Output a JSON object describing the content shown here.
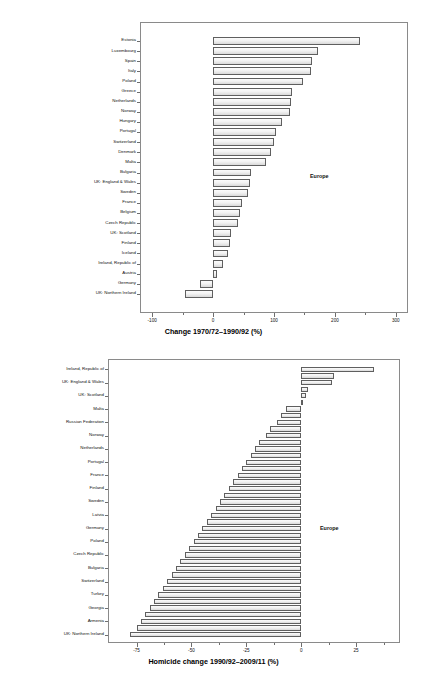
{
  "figure": {
    "background": "#ffffff",
    "bar_fill": "#eeeeee",
    "bar_edge": "#5f5f5f"
  },
  "chart_data": [
    {
      "id": "chart-top",
      "type": "bar",
      "orientation": "horizontal",
      "title": "",
      "xlabel": "Change 1970/72–1990/92 (%)",
      "ylabel": "",
      "xlim": [
        -120,
        320
      ],
      "xticks": [
        -100,
        0,
        100,
        200,
        300
      ],
      "xtick_labels": [
        "-100",
        "0",
        "100",
        "200",
        "300"
      ],
      "xminor_ticks": [
        -50,
        50,
        150,
        250
      ],
      "grid": false,
      "legend": "none",
      "annotation": "Europe",
      "categories": [
        "Estonia",
        "Luxembourg",
        "Spain",
        "Italy",
        "Poland",
        "Greece",
        "Netherlands",
        "Norway",
        "Hungary",
        "Portugal",
        "Switzerland",
        "Denmark",
        "Malta",
        "Bulgaria",
        "UK: England & Wales",
        "Sweden",
        "France",
        "Belgium",
        "Czech Republic",
        "UK: Scotland",
        "Finland",
        "Iceland",
        "Ireland, Republic of",
        "Austria",
        "Germany",
        "UK: Northern Ireland"
      ],
      "values": [
        241,
        172,
        162,
        160,
        147,
        130,
        128,
        127,
        113,
        103,
        100,
        95,
        87,
        62,
        60,
        57,
        48,
        45,
        41,
        30,
        28,
        24,
        17,
        7,
        -21,
        -46
      ]
    },
    {
      "id": "chart-bottom",
      "type": "bar",
      "orientation": "horizontal",
      "title": "",
      "xlabel": "Homicide change 1990/92–2009/11 (%)",
      "ylabel": "",
      "xlim": [
        -88,
        45
      ],
      "xticks": [
        -75,
        -50,
        -25,
        0,
        25
      ],
      "xtick_labels": [
        "-75",
        "-50",
        "-25",
        "0",
        "25"
      ],
      "xminor_ticks": [
        -62.5,
        -37.5,
        -12.5,
        12.5,
        37.5
      ],
      "grid": false,
      "legend": "none",
      "annotation": "Europe",
      "categories": [
        "Ireland, Republic of",
        "Luxembourg",
        "UK: England & Wales",
        "Iceland",
        "UK: Scotland",
        "Greece",
        "Malta",
        "Denmark",
        "Russian Federation",
        "Belgium",
        "Norway",
        "Spain",
        "Netherlands",
        "Austria",
        "Portugal",
        "Italy",
        "France",
        "Hungary",
        "Finland",
        "Slovakia",
        "Sweden",
        "Lithuania",
        "Latvia",
        "Slovenia",
        "Germany",
        "Croatia",
        "Poland",
        "Romania",
        "Czech Republic",
        "Ukraine",
        "Bulgaria",
        "Belarus",
        "Switzerland",
        "Albania",
        "Turkey",
        "Moldova",
        "Georgia",
        "Azerbaijan",
        "Armenia",
        "Cyprus",
        "UK: Northern Ireland"
      ],
      "values": [
        33,
        15,
        14,
        3,
        2,
        1,
        -7,
        -9,
        -11,
        -14,
        -16,
        -19,
        -21,
        -23,
        -25,
        -27,
        -29,
        -31,
        -33,
        -35,
        -37,
        -39,
        -41,
        -43,
        -45,
        -47,
        -49,
        -51,
        -53,
        -55,
        -57,
        -59,
        -61,
        -63,
        -65,
        -67,
        -69,
        -71,
        -73,
        -75,
        -78
      ]
    }
  ]
}
